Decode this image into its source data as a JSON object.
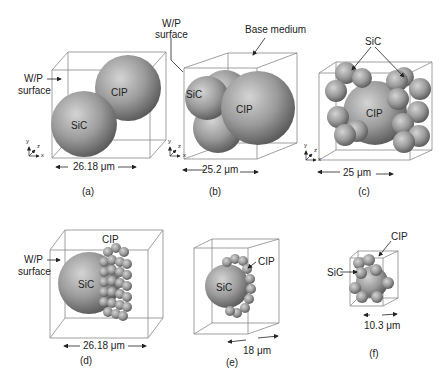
{
  "figure": {
    "panels": [
      {
        "id": "a",
        "caption": "(a)",
        "labels": {
          "wp_surface_line1": "W/P",
          "wp_surface_line2": "surface",
          "sic": "SiC",
          "cip": "CIP"
        },
        "dimension": "26.18 μm",
        "axes": {
          "x": "x",
          "y": "y",
          "z": "z"
        }
      },
      {
        "id": "b",
        "caption": "(b)",
        "labels": {
          "wp_surface_line1": "W/P",
          "wp_surface_line2": "surface",
          "base_medium": "Base medium",
          "sic": "SiC",
          "cip": "CIP"
        },
        "dimension": "25.2 μm",
        "axes": {
          "x": "x",
          "y": "y",
          "z": "z"
        }
      },
      {
        "id": "c",
        "caption": "(c)",
        "labels": {
          "sic": "SiC",
          "cip": "CIP"
        },
        "dimension": "25 μm",
        "axes": {
          "x": "x",
          "y": "y",
          "z": "z"
        }
      },
      {
        "id": "d",
        "caption": "(d)",
        "labels": {
          "wp_surface_line1": "W/P",
          "wp_surface_line2": "surface",
          "sic": "SiC",
          "cip": "CIP"
        },
        "dimension": "26.18 μm"
      },
      {
        "id": "e",
        "caption": "(e)",
        "labels": {
          "sic": "SiC",
          "cip": "CIP"
        },
        "dimension": "18 μm"
      },
      {
        "id": "f",
        "caption": "(f)",
        "labels": {
          "sic": "SiC",
          "cip": "CIP"
        },
        "dimension": "10.3 μm"
      }
    ],
    "colors": {
      "sphere_light": "#d4d4d4",
      "sphere_mid": "#9a9a9a",
      "sphere_dark": "#555555",
      "box_line": "#888888",
      "text": "#222222"
    }
  }
}
